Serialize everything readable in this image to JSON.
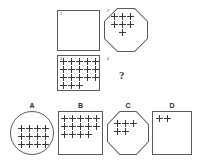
{
  "puzzle": {
    "type": "visual-analogy-matrix",
    "question_mark": "?",
    "matrix": {
      "cells": [
        {
          "index_label": "1",
          "shape": "square",
          "plus_rows": [],
          "plus_count": 0
        },
        {
          "index_label": "2",
          "shape": "octagon",
          "plus_rows": [
            3,
            3,
            1
          ],
          "plus_count": 7
        },
        {
          "index_label": "3",
          "shape": "square",
          "plus_rows": [
            5,
            5,
            5,
            3
          ],
          "plus_count": 18
        },
        {
          "index_label": "4",
          "shape": "none",
          "plus_rows": [],
          "plus_count": 0
        }
      ]
    },
    "options": [
      {
        "label": "A",
        "shape": "circle",
        "plus_rows": [
          4,
          4,
          4
        ],
        "plus_count": 12
      },
      {
        "label": "B",
        "shape": "square",
        "plus_rows": [
          5,
          5,
          4
        ],
        "plus_count": 14
      },
      {
        "label": "C",
        "shape": "octagon",
        "plus_rows": [
          3,
          2
        ],
        "plus_count": 5
      },
      {
        "label": "D",
        "shape": "square",
        "plus_rows": [
          2
        ],
        "plus_count": 2
      }
    ]
  },
  "colors": {
    "background": "#ffffff",
    "stroke": "#5a5a5a",
    "glyph": "#3a3a3a",
    "label": "#2b2b2b"
  }
}
